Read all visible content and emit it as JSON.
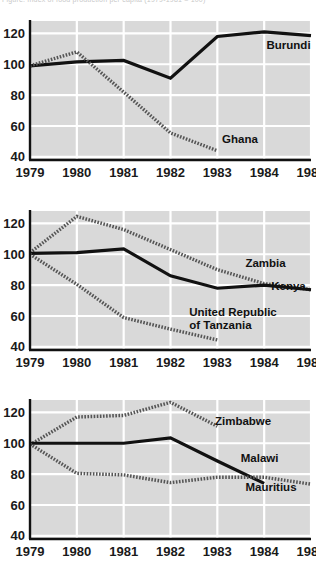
{
  "caption": {
    "fragment": "Figure. Index of food production per capita (1979-1981 = 100)"
  },
  "colors": {
    "plot_background": "#d9d9d9",
    "gridline": "#ffffff",
    "axis": "#111111",
    "solid_series": "#111111",
    "dotted_series": "#555555",
    "text": "#111111"
  },
  "axes": {
    "x_ticks": [
      "1979",
      "1980",
      "1981",
      "1982",
      "1983",
      "1984",
      "1985"
    ],
    "x_values": [
      1979,
      1980,
      1981,
      1982,
      1983,
      1984,
      1985
    ],
    "y_ticks": [
      "40",
      "60",
      "80",
      "100",
      "120"
    ],
    "y_values": [
      40,
      60,
      80,
      100,
      120
    ],
    "ylim": [
      38,
      128
    ],
    "xlim": [
      1979,
      1985
    ],
    "grid": true,
    "legend_position": "inline-end-of-line"
  },
  "chart_data": [
    {
      "type": "line",
      "id": "chart-1",
      "title": "",
      "xlabel": "",
      "ylabel": "",
      "grid": true,
      "ylim": [
        38,
        128
      ],
      "x": [
        1979,
        1980,
        1981,
        1982,
        1983,
        1984,
        1985
      ],
      "xticklabels": [
        "1979",
        "1980",
        "1981",
        "1982",
        "1983",
        "1984",
        "1985"
      ],
      "yticklabels": [
        "40",
        "60",
        "80",
        "100",
        "120"
      ],
      "yticks": [
        40,
        60,
        80,
        100,
        120
      ],
      "series": [
        {
          "name": "Burundi",
          "style": "solid",
          "label_x": 1984.05,
          "label_y": 110,
          "values": [
            99,
            101.5,
            102.5,
            91,
            118,
            121,
            118.5
          ]
        },
        {
          "name": "Ghana",
          "style": "dotted",
          "label_x": 1983.1,
          "label_y": 49,
          "values": [
            99,
            108,
            82,
            55.5,
            44,
            null,
            null
          ]
        }
      ]
    },
    {
      "type": "line",
      "id": "chart-2",
      "title": "",
      "xlabel": "",
      "ylabel": "",
      "grid": true,
      "ylim": [
        38,
        128
      ],
      "x": [
        1979,
        1980,
        1981,
        1982,
        1983,
        1984,
        1985
      ],
      "xticklabels": [
        "1979",
        "1980",
        "1981",
        "1982",
        "1983",
        "1984",
        "1985"
      ],
      "yticklabels": [
        "40",
        "60",
        "80",
        "100",
        "120"
      ],
      "yticks": [
        40,
        60,
        80,
        100,
        120
      ],
      "series": [
        {
          "name": "Zambia",
          "style": "dotted",
          "label_x": 1983.6,
          "label_y": 92,
          "values": [
            101,
            124.5,
            116,
            103,
            90,
            81,
            77
          ]
        },
        {
          "name": "Kenya",
          "style": "solid",
          "label_x": 1984.15,
          "label_y": 77,
          "values": [
            100.5,
            101,
            103.5,
            86,
            78,
            80,
            77
          ]
        },
        {
          "name": "United Republic of Tanzania",
          "style": "dotted",
          "label_x": 1982.4,
          "label_y": 60,
          "values": [
            100,
            80.5,
            59,
            51.5,
            44.5,
            null,
            null
          ]
        }
      ]
    },
    {
      "type": "line",
      "id": "chart-3",
      "title": "",
      "xlabel": "",
      "ylabel": "",
      "grid": true,
      "ylim": [
        38,
        128
      ],
      "x": [
        1979,
        1980,
        1981,
        1982,
        1983,
        1984,
        1985
      ],
      "xticklabels": [
        "1979",
        "1980",
        "1981",
        "1982",
        "1983",
        "1984",
        "1985"
      ],
      "yticklabels": [
        "40",
        "60",
        "80",
        "100",
        "120"
      ],
      "yticks": [
        40,
        60,
        80,
        100,
        120
      ],
      "series": [
        {
          "name": "Zimbabwe",
          "style": "dotted",
          "label_x": 1982.95,
          "label_y": 112,
          "values": [
            99,
            117,
            118,
            126.5,
            111,
            null,
            null
          ]
        },
        {
          "name": "Malawi",
          "style": "solid",
          "label_x": 1983.5,
          "label_y": 88,
          "values": [
            100,
            100,
            100,
            103.5,
            88.5,
            74,
            null
          ]
        },
        {
          "name": "Mauritius",
          "style": "dotted",
          "label_x": 1983.6,
          "label_y": 69,
          "values": [
            99.5,
            80.5,
            79.5,
            74.5,
            78,
            78,
            73.5
          ]
        }
      ]
    }
  ]
}
